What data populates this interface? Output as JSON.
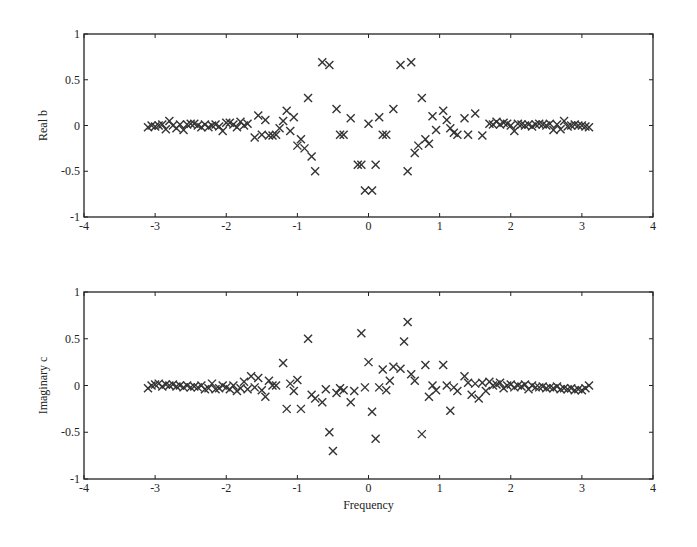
{
  "chart_data": [
    {
      "type": "scatter",
      "title": "",
      "xlabel": "",
      "ylabel": "Real b",
      "xlim": [
        -4,
        4
      ],
      "ylim": [
        -1,
        1
      ],
      "xticks": [
        "-4",
        "-3",
        "-2",
        "-1",
        "0",
        "1",
        "2",
        "3",
        "4"
      ],
      "yticks": [
        "1",
        "0.5",
        "0",
        "-0.5",
        "-1"
      ],
      "grid": false,
      "marker": "x",
      "legend": null,
      "points": [
        [
          -3.1,
          -0.02
        ],
        [
          -3.05,
          0.0
        ],
        [
          -3.0,
          -0.01
        ],
        [
          -2.95,
          0.0
        ],
        [
          -2.9,
          0.01
        ],
        [
          -2.85,
          -0.04
        ],
        [
          -2.8,
          0.05
        ],
        [
          -2.75,
          0.0
        ],
        [
          -2.7,
          -0.03
        ],
        [
          -2.65,
          0.01
        ],
        [
          -2.6,
          -0.05
        ],
        [
          -2.55,
          0.01
        ],
        [
          -2.5,
          0.02
        ],
        [
          -2.45,
          0.02
        ],
        [
          -2.4,
          0.0
        ],
        [
          -2.35,
          -0.02
        ],
        [
          -2.3,
          0.01
        ],
        [
          -2.25,
          -0.02
        ],
        [
          -2.2,
          0.0
        ],
        [
          -2.15,
          0.01
        ],
        [
          -2.1,
          -0.01
        ],
        [
          -2.05,
          -0.06
        ],
        [
          -2.0,
          0.03
        ],
        [
          -1.95,
          0.03
        ],
        [
          -1.9,
          0.01
        ],
        [
          -1.85,
          -0.02
        ],
        [
          -1.8,
          0.04
        ],
        [
          -1.75,
          0.0
        ],
        [
          -1.7,
          0.02
        ],
        [
          -1.6,
          -0.13
        ],
        [
          -1.55,
          0.11
        ],
        [
          -1.5,
          -0.1
        ],
        [
          -1.45,
          0.06
        ],
        [
          -1.4,
          -0.11
        ],
        [
          -1.35,
          -0.11
        ],
        [
          -1.3,
          -0.1
        ],
        [
          -1.25,
          -0.03
        ],
        [
          -1.2,
          0.05
        ],
        [
          -1.15,
          0.16
        ],
        [
          -1.1,
          -0.06
        ],
        [
          -1.05,
          0.09
        ],
        [
          -1.0,
          -0.22
        ],
        [
          -0.95,
          -0.15
        ],
        [
          -0.9,
          -0.25
        ],
        [
          -0.85,
          0.3
        ],
        [
          -0.8,
          -0.34
        ],
        [
          -0.75,
          -0.5
        ],
        [
          -0.65,
          0.69
        ],
        [
          -0.55,
          0.66
        ],
        [
          -0.45,
          0.18
        ],
        [
          -0.4,
          -0.1
        ],
        [
          -0.35,
          -0.1
        ],
        [
          -0.25,
          0.08
        ],
        [
          -0.15,
          -0.43
        ],
        [
          -0.1,
          -0.43
        ],
        [
          -0.05,
          -0.71
        ],
        [
          0.0,
          0.02
        ],
        [
          0.05,
          -0.71
        ],
        [
          0.1,
          -0.43
        ],
        [
          0.15,
          0.09
        ],
        [
          0.2,
          -0.1
        ],
        [
          0.25,
          -0.1
        ],
        [
          0.35,
          0.18
        ],
        [
          0.45,
          0.66
        ],
        [
          0.55,
          -0.5
        ],
        [
          0.6,
          0.69
        ],
        [
          0.65,
          -0.3
        ],
        [
          0.7,
          -0.22
        ],
        [
          0.75,
          0.3
        ],
        [
          0.8,
          -0.15
        ],
        [
          0.85,
          -0.2
        ],
        [
          0.9,
          0.1
        ],
        [
          0.95,
          -0.05
        ],
        [
          1.05,
          0.16
        ],
        [
          1.1,
          0.06
        ],
        [
          1.15,
          -0.03
        ],
        [
          1.2,
          -0.08
        ],
        [
          1.25,
          -0.1
        ],
        [
          1.35,
          0.08
        ],
        [
          1.4,
          -0.1
        ],
        [
          1.5,
          0.13
        ],
        [
          1.6,
          -0.11
        ],
        [
          1.7,
          0.02
        ],
        [
          1.75,
          0.01
        ],
        [
          1.8,
          0.04
        ],
        [
          1.85,
          0.01
        ],
        [
          1.9,
          0.03
        ],
        [
          1.95,
          0.02
        ],
        [
          2.0,
          0.0
        ],
        [
          2.05,
          -0.06
        ],
        [
          2.1,
          0.02
        ],
        [
          2.15,
          0.01
        ],
        [
          2.2,
          0.0
        ],
        [
          2.25,
          0.01
        ],
        [
          2.3,
          -0.01
        ],
        [
          2.35,
          0.01
        ],
        [
          2.4,
          0.02
        ],
        [
          2.45,
          0.01
        ],
        [
          2.5,
          0.0
        ],
        [
          2.55,
          0.02
        ],
        [
          2.6,
          -0.05
        ],
        [
          2.65,
          0.01
        ],
        [
          2.7,
          -0.04
        ],
        [
          2.75,
          0.05
        ],
        [
          2.8,
          -0.01
        ],
        [
          2.85,
          0.0
        ],
        [
          2.9,
          0.01
        ],
        [
          2.95,
          0.0
        ],
        [
          3.0,
          0.0
        ],
        [
          3.05,
          -0.01
        ],
        [
          3.1,
          -0.02
        ]
      ]
    },
    {
      "type": "scatter",
      "title": "",
      "xlabel": "Frequency",
      "ylabel": "Imaginary c",
      "xlim": [
        -4,
        4
      ],
      "ylim": [
        -1,
        1
      ],
      "xticks": [
        "-4",
        "-3",
        "-2",
        "-1",
        "0",
        "1",
        "2",
        "3",
        "4"
      ],
      "yticks": [
        "1",
        "0.5",
        "0",
        "-0.5",
        "-1"
      ],
      "grid": false,
      "marker": "x",
      "legend": null,
      "points": [
        [
          -3.1,
          -0.03
        ],
        [
          -3.05,
          0.0
        ],
        [
          -3.0,
          0.01
        ],
        [
          -2.95,
          0.02
        ],
        [
          -2.9,
          -0.01
        ],
        [
          -2.85,
          0.01
        ],
        [
          -2.8,
          0.0
        ],
        [
          -2.75,
          0.01
        ],
        [
          -2.7,
          -0.01
        ],
        [
          -2.65,
          0.0
        ],
        [
          -2.6,
          -0.02
        ],
        [
          -2.55,
          0.0
        ],
        [
          -2.5,
          -0.02
        ],
        [
          -2.45,
          -0.01
        ],
        [
          -2.4,
          -0.02
        ],
        [
          -2.35,
          0.0
        ],
        [
          -2.3,
          -0.04
        ],
        [
          -2.25,
          -0.03
        ],
        [
          -2.2,
          0.02
        ],
        [
          -2.15,
          -0.04
        ],
        [
          -2.1,
          -0.03
        ],
        [
          -2.05,
          0.0
        ],
        [
          -2.0,
          -0.02
        ],
        [
          -1.95,
          -0.04
        ],
        [
          -1.9,
          0.0
        ],
        [
          -1.85,
          -0.06
        ],
        [
          -1.8,
          -0.03
        ],
        [
          -1.75,
          0.04
        ],
        [
          -1.7,
          -0.04
        ],
        [
          -1.65,
          0.1
        ],
        [
          -1.6,
          -0.02
        ],
        [
          -1.55,
          0.08
        ],
        [
          -1.5,
          -0.05
        ],
        [
          -1.45,
          -0.12
        ],
        [
          -1.4,
          0.05
        ],
        [
          -1.35,
          0.0
        ],
        [
          -1.3,
          0.0
        ],
        [
          -1.2,
          0.24
        ],
        [
          -1.15,
          -0.25
        ],
        [
          -1.1,
          0.02
        ],
        [
          -1.05,
          -0.06
        ],
        [
          -1.0,
          0.06
        ],
        [
          -0.95,
          -0.25
        ],
        [
          -0.85,
          0.5
        ],
        [
          -0.8,
          -0.1
        ],
        [
          -0.75,
          -0.14
        ],
        [
          -0.65,
          -0.18
        ],
        [
          -0.6,
          -0.04
        ],
        [
          -0.55,
          -0.5
        ],
        [
          -0.5,
          -0.7
        ],
        [
          -0.45,
          -0.08
        ],
        [
          -0.4,
          -0.03
        ],
        [
          -0.35,
          -0.05
        ],
        [
          -0.25,
          -0.18
        ],
        [
          -0.2,
          -0.06
        ],
        [
          -0.1,
          0.56
        ],
        [
          -0.05,
          -0.02
        ],
        [
          0.0,
          0.25
        ],
        [
          0.05,
          -0.28
        ],
        [
          0.1,
          -0.57
        ],
        [
          0.15,
          -0.02
        ],
        [
          0.2,
          0.17
        ],
        [
          0.25,
          -0.05
        ],
        [
          0.3,
          0.05
        ],
        [
          0.35,
          0.2
        ],
        [
          0.45,
          0.18
        ],
        [
          0.5,
          0.47
        ],
        [
          0.55,
          0.68
        ],
        [
          0.6,
          0.12
        ],
        [
          0.65,
          0.05
        ],
        [
          0.75,
          -0.52
        ],
        [
          0.8,
          0.22
        ],
        [
          0.85,
          -0.12
        ],
        [
          0.9,
          0.0
        ],
        [
          0.95,
          -0.05
        ],
        [
          1.05,
          0.22
        ],
        [
          1.1,
          0.0
        ],
        [
          1.15,
          -0.27
        ],
        [
          1.2,
          -0.02
        ],
        [
          1.25,
          -0.06
        ],
        [
          1.35,
          0.1
        ],
        [
          1.4,
          0.03
        ],
        [
          1.45,
          -0.1
        ],
        [
          1.5,
          0.02
        ],
        [
          1.55,
          -0.14
        ],
        [
          1.6,
          0.03
        ],
        [
          1.65,
          -0.06
        ],
        [
          1.7,
          0.04
        ],
        [
          1.75,
          0.0
        ],
        [
          1.8,
          0.01
        ],
        [
          1.85,
          0.03
        ],
        [
          1.9,
          -0.03
        ],
        [
          1.95,
          0.0
        ],
        [
          2.0,
          0.01
        ],
        [
          2.05,
          -0.02
        ],
        [
          2.1,
          0.0
        ],
        [
          2.15,
          -0.01
        ],
        [
          2.2,
          0.01
        ],
        [
          2.25,
          -0.04
        ],
        [
          2.3,
          0.0
        ],
        [
          2.35,
          -0.02
        ],
        [
          2.4,
          -0.02
        ],
        [
          2.45,
          -0.01
        ],
        [
          2.5,
          -0.03
        ],
        [
          2.55,
          -0.02
        ],
        [
          2.6,
          -0.03
        ],
        [
          2.65,
          -0.01
        ],
        [
          2.7,
          -0.04
        ],
        [
          2.75,
          -0.03
        ],
        [
          2.8,
          -0.04
        ],
        [
          2.85,
          -0.03
        ],
        [
          2.9,
          -0.05
        ],
        [
          2.95,
          -0.04
        ],
        [
          3.0,
          -0.05
        ],
        [
          3.05,
          -0.03
        ],
        [
          3.1,
          0.0
        ]
      ]
    }
  ]
}
